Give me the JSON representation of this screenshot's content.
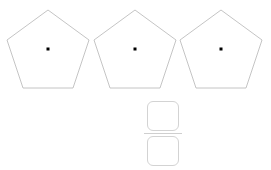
{
  "page": {
    "background_color": "#ffffff",
    "width": 271,
    "height": 170
  },
  "shapes": {
    "kind": "pentagon",
    "count": 3,
    "stroke_color": "#bdbdbd",
    "fill_color": "#ffffff",
    "center_dot_color": "#000000",
    "items": [
      {
        "label": "pentagon-1",
        "x": 3,
        "center_marked": true
      },
      {
        "label": "pentagon-2",
        "x": 90,
        "center_marked": true
      },
      {
        "label": "pentagon-3",
        "x": 176,
        "center_marked": true
      }
    ]
  },
  "equation": {
    "expression": "3÷5=",
    "dividend": "3",
    "operator": "÷",
    "divisor": "5",
    "equals": "=",
    "text_color": "#4a4a4a",
    "answer": {
      "type": "fraction",
      "numerator_value": "",
      "denominator_value": "",
      "numerator_placeholder": "",
      "denominator_placeholder": "",
      "box_border_color": "#d3d3d3",
      "bar_color": "#cfcfcf"
    }
  }
}
